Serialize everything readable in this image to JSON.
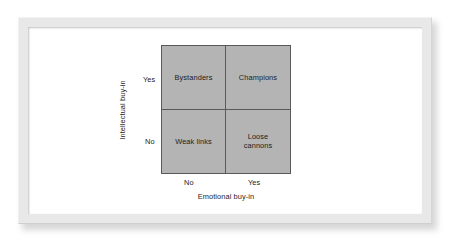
{
  "figure": {
    "frame_color": "#e8e8e8",
    "background_color": "#ffffff",
    "quadrant_fill": "#b4b4b4",
    "line_color": "#59595b",
    "text_color": "#1d1d1d"
  },
  "chart_data": {
    "type": "table",
    "title": "",
    "xlabel": "Emotional buy-in",
    "ylabel": "Intellectual buy-in",
    "x_ticks": [
      "No",
      "Yes"
    ],
    "y_ticks": [
      "Yes",
      "No"
    ],
    "grid": true,
    "legend": "none",
    "categories": [
      "No",
      "Yes"
    ],
    "cells": [
      {
        "x": "No",
        "y": "Yes",
        "label": "Bystanders",
        "position": "top-left"
      },
      {
        "x": "Yes",
        "y": "Yes",
        "label": "Champions",
        "position": "top-right"
      },
      {
        "x": "No",
        "y": "No",
        "label": "Weak links",
        "position": "bottom-left"
      },
      {
        "x": "Yes",
        "y": "No",
        "label": "Loose\ncannons",
        "position": "bottom-right"
      }
    ]
  },
  "matrix": {
    "top_left": "Bystanders",
    "top_right": "Champions",
    "bottom_left": "Weak links",
    "bottom_right": "Loose\ncannons"
  },
  "axes": {
    "y": {
      "title": "Intellectual buy-in",
      "tick_high": "Yes",
      "tick_low": "No"
    },
    "x": {
      "title": "Emotional buy-in",
      "tick_low": "No",
      "tick_high": "Yes"
    }
  }
}
